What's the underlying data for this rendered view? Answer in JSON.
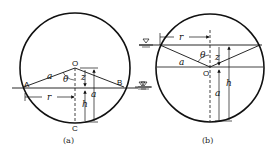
{
  "figure": {
    "panels": [
      {
        "id": "a",
        "caption": "(a)",
        "points": {
          "A": "A",
          "B": "B",
          "O": "O",
          "C": "C"
        },
        "labels": {
          "radius": "a",
          "angle": "θ",
          "z": "z",
          "h": "h",
          "a_dim": "a",
          "r": "r"
        },
        "water_symbol": "▽"
      },
      {
        "id": "b",
        "caption": "(b)",
        "points": {
          "O": "O"
        },
        "labels": {
          "radius": "a",
          "angle": "θ",
          "z": "z",
          "h": "h",
          "a_dim": "a",
          "r": "r"
        },
        "water_symbol": "▽"
      }
    ],
    "colors": {
      "stroke": "#111111",
      "background": "#ffffff"
    }
  }
}
